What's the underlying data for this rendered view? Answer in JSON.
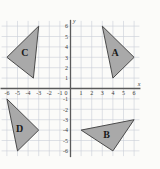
{
  "chart_data": {
    "type": "scatter",
    "title": "",
    "xlabel": "x",
    "ylabel": "y",
    "xlim": [
      -6.5,
      6.5
    ],
    "ylim": [
      -6.5,
      6.5
    ],
    "grid": true,
    "grid_step": 1,
    "legend_position": "none",
    "x_ticks": [
      "-6",
      "-5",
      "-4",
      "-3",
      "-2",
      "-1",
      "0",
      "1",
      "2",
      "3",
      "4",
      "5",
      "6"
    ],
    "y_ticks": [
      "6",
      "5",
      "4",
      "3",
      "2",
      "1",
      "-1",
      "-2",
      "-3",
      "-4",
      "-5",
      "-6"
    ],
    "origin_label": "0",
    "shapes": [
      {
        "label": "A",
        "quadrant": "I",
        "vertices": [
          [
            3,
            6
          ],
          [
            6,
            3
          ],
          [
            4,
            1
          ]
        ],
        "label_at": [
          4.2,
          3.3
        ],
        "fill": "#a9a9a9",
        "stroke": "#4a4a4a"
      },
      {
        "label": "B",
        "quadrant": "IV",
        "vertices": [
          [
            1,
            -4
          ],
          [
            6,
            -3
          ],
          [
            4,
            -6
          ]
        ],
        "label_at": [
          3.4,
          -4.5
        ],
        "fill": "#a9a9a9",
        "stroke": "#4a4a4a"
      },
      {
        "label": "C",
        "quadrant": "II",
        "vertices": [
          [
            -3,
            6
          ],
          [
            -6,
            3
          ],
          [
            -3.5,
            1
          ]
        ],
        "label_at": [
          -4.3,
          3.3
        ],
        "fill": "#a9a9a9",
        "stroke": "#4a4a4a"
      },
      {
        "label": "D",
        "quadrant": "III",
        "vertices": [
          [
            -6,
            -1
          ],
          [
            -3,
            -4
          ],
          [
            -5,
            -6
          ]
        ],
        "label_at": [
          -4.8,
          -4.0
        ],
        "fill": "#a9a9a9",
        "stroke": "#4a4a4a"
      }
    ]
  },
  "colors": {
    "background": "#fbfbf9",
    "grid_line": "#c9cfd6",
    "axis_line": "#5a5a5a",
    "shape_fill": "#a9a9a9",
    "shape_stroke": "#4a4a4a",
    "tick_text": "#3a3a3a"
  }
}
